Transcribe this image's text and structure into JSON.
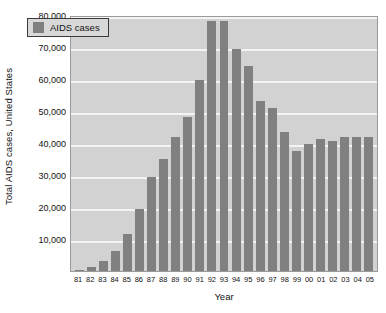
{
  "chart_data": {
    "type": "bar",
    "title": "",
    "xlabel": "Year",
    "ylabel": "Total AIDS cases, United States",
    "ylim": [
      0,
      80000
    ],
    "ytick_values": [
      10000,
      20000,
      30000,
      40000,
      50000,
      60000,
      70000,
      80000
    ],
    "ytick_labels": [
      "10,000",
      "20,000",
      "30,000",
      "40,000",
      "50,000",
      "60,000",
      "70,000",
      "80,000"
    ],
    "grid": true,
    "legend_position": "top-left",
    "series": [
      {
        "name": "AIDS cases",
        "color": "#808080",
        "values": [
          320,
          1200,
          3100,
          6200,
          11500,
          19500,
          29500,
          35000,
          41800,
          48200,
          59800,
          78000,
          78000,
          69500,
          64000,
          53000,
          51000,
          43500,
          37500,
          39800,
          41400,
          40500,
          42000,
          42000,
          42000
        ]
      }
    ],
    "categories": [
      "81",
      "82",
      "83",
      "84",
      "85",
      "86",
      "87",
      "88",
      "89",
      "90",
      "91",
      "92",
      "93",
      "94",
      "95",
      "96",
      "97",
      "98",
      "99",
      "00",
      "01",
      "02",
      "03",
      "04",
      "05"
    ]
  },
  "legend": {
    "entries": [
      {
        "label": "AIDS cases",
        "color": "#808080"
      }
    ]
  },
  "colors": {
    "bar": "#808080",
    "plot_background": "#d2d2d2",
    "gridline": "#f4f4f4",
    "page_background": "#ffffff",
    "text": "#121212"
  }
}
